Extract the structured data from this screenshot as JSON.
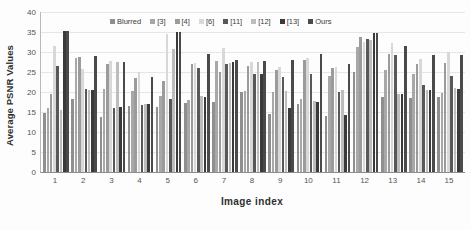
{
  "chart_data": {
    "type": "bar",
    "title": "",
    "xlabel": "Image index",
    "ylabel": "Average PSNR Values",
    "ylim": [
      0,
      40
    ],
    "ytick_values": [
      40,
      35,
      30,
      25,
      20,
      15,
      10,
      5,
      0
    ],
    "grid": true,
    "legend_position": "top-center",
    "categories": [
      "1",
      "2",
      "3",
      "4",
      "5",
      "6",
      "7",
      "8",
      "9",
      "10",
      "11",
      "12",
      "13",
      "14",
      "15"
    ],
    "series": [
      {
        "name": "Blurred",
        "color": "#8f8f8f",
        "values": [
          14.7,
          18.3,
          13.8,
          16.4,
          16.2,
          17.2,
          17.5,
          20.1,
          14.6,
          16.9,
          14.0,
          25.0,
          18.8,
          18.6,
          18.7
        ]
      },
      {
        "name": "[3]",
        "color": "#a8a8a8",
        "values": [
          16.1,
          28.6,
          20.7,
          20.3,
          19.0,
          17.9,
          27.8,
          20.2,
          19.9,
          18.3,
          23.9,
          31.2,
          25.4,
          24.5,
          19.8
        ]
      },
      {
        "name": "[4]",
        "color": "#9b9b9b",
        "values": [
          19.5,
          28.7,
          26.9,
          23.6,
          22.7,
          27.0,
          24.9,
          26.5,
          25.5,
          28.1,
          26.1,
          33.7,
          29.4,
          26.9,
          27.3
        ]
      },
      {
        "name": "[6]",
        "color": "#d8d8d8",
        "values": [
          31.6,
          25.8,
          27.8,
          24.9,
          34.4,
          27.3,
          31.1,
          27.5,
          26.3,
          28.6,
          26.2,
          32.4,
          32.2,
          28.2,
          30.1
        ]
      },
      {
        "name": "[11]",
        "color": "#585858",
        "values": [
          26.4,
          20.7,
          16.1,
          16.8,
          18.2,
          26.0,
          27.0,
          24.4,
          23.8,
          24.4,
          20.0,
          33.3,
          29.3,
          21.7,
          24.1
        ]
      },
      {
        "name": "[12]",
        "color": "#bdbdbd",
        "values": [
          15.6,
          20.6,
          27.5,
          17.0,
          30.7,
          19.0,
          27.3,
          27.6,
          20.2,
          17.7,
          20.5,
          33.0,
          19.6,
          20.5,
          20.9
        ]
      },
      {
        "name": "[13]",
        "color": "#3a3a3a",
        "values": [
          35.2,
          20.5,
          16.2,
          17.0,
          35.1,
          18.8,
          27.6,
          24.6,
          16.1,
          17.6,
          14.3,
          34.8,
          19.5,
          20.4,
          20.8
        ]
      },
      {
        "name": "Ours",
        "color": "#4a4a4a",
        "values": [
          35.2,
          29.1,
          27.5,
          23.7,
          35.1,
          29.6,
          27.9,
          27.8,
          27.9,
          29.4,
          26.9,
          34.8,
          31.4,
          29.3,
          29.2
        ]
      }
    ]
  }
}
